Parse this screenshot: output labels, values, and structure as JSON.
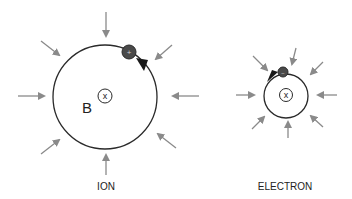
{
  "diagram": {
    "ion": {
      "label": "ION",
      "field_label": "B",
      "field_symbol": "x",
      "particle_charge": "+",
      "rotation": "counterclockwise"
    },
    "electron": {
      "label": "ELECTRON",
      "field_symbol": "x",
      "particle_charge": "−",
      "rotation": "clockwise"
    },
    "colors": {
      "orbit": "#2a2a2a",
      "force_arrows": "#8a8a8a",
      "particle": "#4a4a4a",
      "text": "#222222"
    }
  }
}
